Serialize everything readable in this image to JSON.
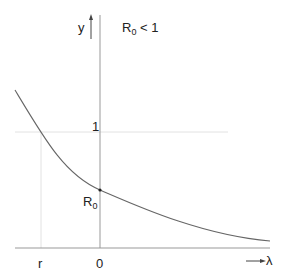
{
  "diagram": {
    "y_axis_label": "y",
    "x_axis_label": "λ",
    "condition_main": "R",
    "condition_sub": "0",
    "condition_rest": " < 1",
    "tick_one": "1",
    "point_label_main": "R",
    "point_label_sub": "0",
    "x_tick_r": "r",
    "x_tick_zero": "0",
    "colors": {
      "axis": "#888888",
      "curve": "#555555",
      "guide": "#dddddd"
    }
  }
}
